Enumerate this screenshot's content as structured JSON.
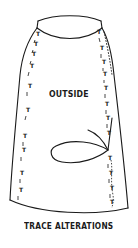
{
  "diagram": {
    "labels": {
      "inside_label": "OUTSIDE",
      "caption": "TRACE ALTERATIONS"
    },
    "marks": {
      "tailor_tack_glyph": "T",
      "left_seam_tacks": 10,
      "right_seam_tacks": 14
    },
    "colors": {
      "line": "#1a1a1a",
      "background": "#ffffff"
    }
  }
}
